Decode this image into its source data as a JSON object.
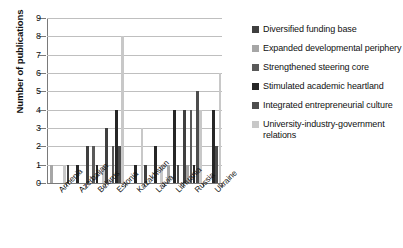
{
  "chart_data": {
    "type": "bar",
    "title": "",
    "xlabel": "",
    "ylabel": "Number of publications",
    "ylim": [
      0,
      9
    ],
    "ytick_step": 1,
    "yticks": [
      "0",
      "1",
      "2",
      "3",
      "4",
      "5",
      "6",
      "7",
      "8",
      "9"
    ],
    "grid": true,
    "legend_position": "right",
    "categories": [
      "Armenia",
      "Azerbaijan",
      "Belarus",
      "Estonia",
      "Kazakhstan",
      "Latvia",
      "Lithuania",
      "Russia",
      "Ukraine"
    ],
    "series": [
      {
        "name": "Diversified funding base",
        "color": "#3f3f3f",
        "values": [
          0,
          1,
          2,
          3,
          0,
          1,
          0,
          4,
          0
        ]
      },
      {
        "name": "Expanded developmental periphery",
        "color": "#a6a6a6",
        "values": [
          1,
          0,
          0,
          0,
          0,
          0,
          1,
          1,
          0
        ]
      },
      {
        "name": "Strengthened steering core",
        "color": "#595959",
        "values": [
          0,
          0,
          2,
          2,
          0,
          0,
          0,
          4,
          0
        ]
      },
      {
        "name": "Stimulated academic heartland",
        "color": "#262626",
        "values": [
          0,
          1,
          1,
          4,
          1,
          2,
          4,
          1,
          4
        ]
      },
      {
        "name": "Integrated entrepreneurial culture",
        "color": "#4d4d4d",
        "values": [
          0,
          0,
          0,
          2,
          0,
          0,
          1,
          5,
          2
        ]
      },
      {
        "name": "University-industry-government relations",
        "color": "#c8c8c8",
        "values": [
          1,
          0,
          1,
          8,
          3,
          1,
          0,
          4,
          6
        ]
      }
    ]
  },
  "axis": {
    "y_title": "Number of publications"
  }
}
